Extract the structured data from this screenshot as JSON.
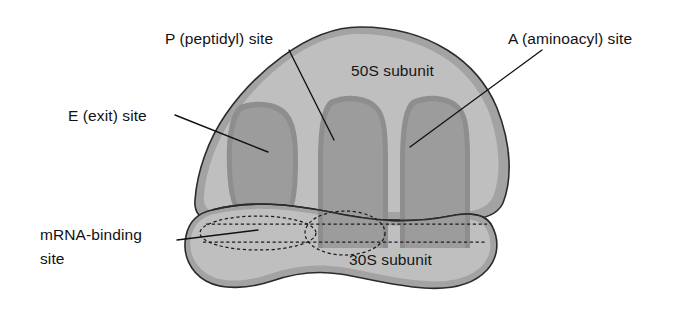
{
  "figure": {
    "background_color": "#ffffff"
  },
  "labels": {
    "p_site": "P (peptidyl) site",
    "a_site": "A (aminoacyl) site",
    "e_site": "E (exit) site",
    "mrna_line1": "mRNA-binding",
    "mrna_line2": "site",
    "subunit_50s": "50S subunit",
    "subunit_30s": "30S subunit"
  },
  "colors": {
    "body_light": "#bfbfbf",
    "body_rim": "#a3a3a3",
    "groove_dark": "#9c9c9c",
    "groove_edge": "#8e8e8e",
    "outline": "#2b2b2b",
    "leader": "#111111",
    "text": "#121212",
    "background": "#ffffff"
  },
  "icons": {
    "leader_p": "leader-line-icon",
    "leader_a": "leader-line-icon",
    "leader_e": "leader-line-icon",
    "leader_mrna": "leader-line-icon"
  }
}
